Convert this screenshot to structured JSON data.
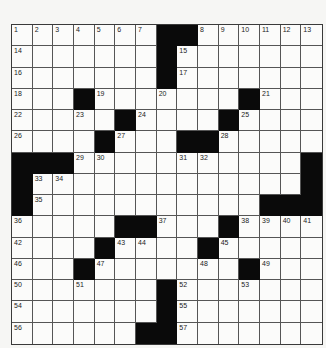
{
  "puzzle": {
    "rows": 15,
    "cols": 15,
    "colors": {
      "black": "#0a0a0a",
      "white": "#fbfbfa",
      "grid_line": "#555555"
    },
    "layout": [
      "1......##1.....",
      "1......#1......",
      "1......#1......",
      "1..#1..1...#1..",
      "1..1.#1...#1...",
      "1...#1..##1....",
      "###11...11....#",
      "#11...........#",
      "#1..........###",
      "1....##1..#1111",
      "1...#11..#1....",
      "1..#1....1.#1..",
      "1..1...#1..1...",
      "1......#1......",
      "1.....##1......"
    ],
    "numbers": [
      {
        "n": "1",
        "r": 0,
        "c": 0
      },
      {
        "n": "2",
        "r": 0,
        "c": 1
      },
      {
        "n": "3",
        "r": 0,
        "c": 2
      },
      {
        "n": "4",
        "r": 0,
        "c": 3
      },
      {
        "n": "5",
        "r": 0,
        "c": 4
      },
      {
        "n": "6",
        "r": 0,
        "c": 5
      },
      {
        "n": "7",
        "r": 0,
        "c": 6
      },
      {
        "n": "8",
        "r": 0,
        "c": 9
      },
      {
        "n": "9",
        "r": 0,
        "c": 10
      },
      {
        "n": "10",
        "r": 0,
        "c": 11
      },
      {
        "n": "11",
        "r": 0,
        "c": 12
      },
      {
        "n": "12",
        "r": 0,
        "c": 13
      },
      {
        "n": "13",
        "r": 0,
        "c": 14
      },
      {
        "n": "14",
        "r": 1,
        "c": 0
      },
      {
        "n": "15",
        "r": 1,
        "c": 8
      },
      {
        "n": "16",
        "r": 2,
        "c": 0
      },
      {
        "n": "17",
        "r": 2,
        "c": 8
      },
      {
        "n": "18",
        "r": 3,
        "c": 0
      },
      {
        "n": "19",
        "r": 3,
        "c": 4
      },
      {
        "n": "20",
        "r": 3,
        "c": 7
      },
      {
        "n": "21",
        "r": 3,
        "c": 12
      },
      {
        "n": "22",
        "r": 4,
        "c": 0
      },
      {
        "n": "23",
        "r": 4,
        "c": 3
      },
      {
        "n": "24",
        "r": 4,
        "c": 6
      },
      {
        "n": "25",
        "r": 4,
        "c": 11
      },
      {
        "n": "26",
        "r": 5,
        "c": 0
      },
      {
        "n": "27",
        "r": 5,
        "c": 5
      },
      {
        "n": "28",
        "r": 5,
        "c": 10
      },
      {
        "n": "29",
        "r": 6,
        "c": 3
      },
      {
        "n": "30",
        "r": 6,
        "c": 4
      },
      {
        "n": "31",
        "r": 6,
        "c": 8
      },
      {
        "n": "32",
        "r": 6,
        "c": 9
      },
      {
        "n": "33",
        "r": 7,
        "c": 1
      },
      {
        "n": "34",
        "r": 7,
        "c": 2
      },
      {
        "n": "35",
        "r": 8,
        "c": 1
      },
      {
        "n": "36",
        "r": 9,
        "c": 0
      },
      {
        "n": "37",
        "r": 9,
        "c": 7
      },
      {
        "n": "38",
        "r": 9,
        "c": 11
      },
      {
        "n": "39",
        "r": 9,
        "c": 12
      },
      {
        "n": "40",
        "r": 9,
        "c": 13
      },
      {
        "n": "41",
        "r": 9,
        "c": 14
      },
      {
        "n": "42",
        "r": 10,
        "c": 0
      },
      {
        "n": "43",
        "r": 10,
        "c": 5
      },
      {
        "n": "44",
        "r": 10,
        "c": 6
      },
      {
        "n": "45",
        "r": 10,
        "c": 10
      },
      {
        "n": "46",
        "r": 11,
        "c": 0
      },
      {
        "n": "47",
        "r": 11,
        "c": 4
      },
      {
        "n": "48",
        "r": 11,
        "c": 9
      },
      {
        "n": "49",
        "r": 11,
        "c": 12
      },
      {
        "n": "50",
        "r": 12,
        "c": 0
      },
      {
        "n": "51",
        "r": 12,
        "c": 3
      },
      {
        "n": "52",
        "r": 12,
        "c": 8
      },
      {
        "n": "53",
        "r": 12,
        "c": 11
      },
      {
        "n": "54",
        "r": 13,
        "c": 0
      },
      {
        "n": "55",
        "r": 13,
        "c": 8
      },
      {
        "n": "56",
        "r": 14,
        "c": 0
      },
      {
        "n": "57",
        "r": 14,
        "c": 8
      }
    ]
  }
}
